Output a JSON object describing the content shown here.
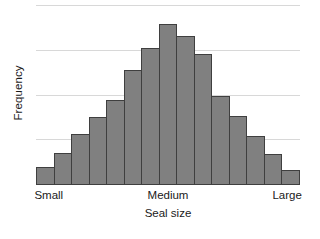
{
  "chart_data": {
    "type": "bar",
    "title": "",
    "subtitle": "",
    "xlabel": "Seal size",
    "ylabel": "Frequency",
    "categories": [
      "1",
      "2",
      "3",
      "4",
      "5",
      "6",
      "7",
      "8",
      "9",
      "10",
      "11",
      "12",
      "13",
      "14",
      "15"
    ],
    "values": [
      0.41,
      0.71,
      1.13,
      1.52,
      1.91,
      2.57,
      3.06,
      3.59,
      3.33,
      2.92,
      2.0,
      1.54,
      1.1,
      0.69,
      0.34
    ],
    "series": [
      {
        "name": "Frequency",
        "values": [
          0.41,
          0.71,
          1.13,
          1.52,
          1.91,
          2.57,
          3.06,
          3.59,
          3.33,
          2.92,
          2.0,
          1.54,
          1.1,
          0.69,
          0.34
        ]
      }
    ],
    "xtick_labels": [
      "Small",
      "Medium",
      "Large"
    ],
    "xtick_positions": [
      0.043,
      0.5,
      0.957
    ],
    "ylim": [
      0,
      4.0
    ],
    "xlim": [
      0,
      15
    ],
    "grid": true,
    "gridline_values": [
      1,
      2,
      3,
      4
    ],
    "legend": false,
    "legend_position": "none",
    "bar_fill_color": "#808080",
    "bar_edge_color": "#3f3f3f",
    "gridline_color": "#d8d8d8",
    "background_color": "#ffffff",
    "text_color": "#1a1a1a",
    "y_axis_ticks_visible": false,
    "annotations": []
  }
}
